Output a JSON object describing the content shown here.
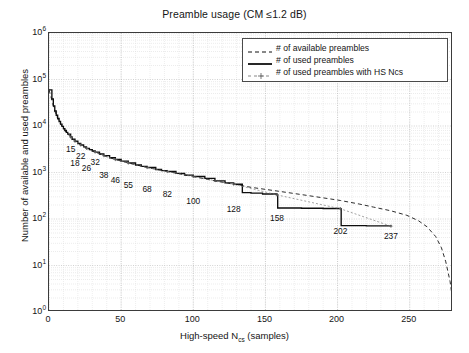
{
  "chart_data": {
    "type": "line",
    "title": "Preamble usage (CM ≤1.2 dB)",
    "xlabel": "High-speed N_cs (samples)",
    "xlabel_main": "High-speed N",
    "xlabel_sub": "cs",
    "xlabel_tail": "(samples)",
    "ylabel": "Number of available and used preambles",
    "xlim": [
      0,
      280
    ],
    "ylim": [
      1,
      1000000
    ],
    "yscale": "log",
    "grid": true,
    "legend_position": "upper right",
    "xticks": [
      0,
      50,
      100,
      150,
      200,
      250
    ],
    "yticks": [
      {
        "label": "10",
        "exp": "0",
        "value": 1
      },
      {
        "label": "10",
        "exp": "1",
        "value": 10
      },
      {
        "label": "10",
        "exp": "2",
        "value": 100
      },
      {
        "label": "10",
        "exp": "3",
        "value": 1000
      },
      {
        "label": "10",
        "exp": "4",
        "value": 10000
      },
      {
        "label": "10",
        "exp": "5",
        "value": 100000
      },
      {
        "label": "10",
        "exp": "6",
        "value": 1000000
      }
    ],
    "legend": [
      {
        "label": "# of available preambles",
        "style": "dashed",
        "color": "#101010"
      },
      {
        "label": "# of used preambles",
        "style": "solid",
        "color": "#101010"
      },
      {
        "label": "# of used preambles with HS Ncs",
        "style": "dotted-marker",
        "color": "#6b6b6b"
      }
    ],
    "annotations": [
      {
        "text": "15",
        "x": 15,
        "y": 5200
      },
      {
        "text": "18",
        "x": 18,
        "y": 2600
      },
      {
        "text": "22",
        "x": 22,
        "y": 3700
      },
      {
        "text": "26",
        "x": 26,
        "y": 2050
      },
      {
        "text": "32",
        "x": 32,
        "y": 2750
      },
      {
        "text": "38",
        "x": 38,
        "y": 1450
      },
      {
        "text": "46",
        "x": 46,
        "y": 1120
      },
      {
        "text": "55",
        "x": 55,
        "y": 900
      },
      {
        "text": "68",
        "x": 68,
        "y": 720
      },
      {
        "text": "82",
        "x": 82,
        "y": 560
      },
      {
        "text": "100",
        "x": 100,
        "y": 400
      },
      {
        "text": "128",
        "x": 128,
        "y": 265
      },
      {
        "text": "158",
        "x": 158,
        "y": 172
      },
      {
        "text": "202",
        "x": 202,
        "y": 90
      },
      {
        "text": "237",
        "x": 237,
        "y": 72
      }
    ],
    "series": [
      {
        "name": "# of available preambles",
        "style": "dashed",
        "points": [
          [
            0,
            60000
          ],
          [
            2,
            36000
          ],
          [
            4,
            21000
          ],
          [
            6,
            14500
          ],
          [
            8,
            11000
          ],
          [
            10,
            8800
          ],
          [
            12,
            7300
          ],
          [
            15,
            5800
          ],
          [
            18,
            4700
          ],
          [
            22,
            3900
          ],
          [
            26,
            3300
          ],
          [
            32,
            2750
          ],
          [
            38,
            2300
          ],
          [
            46,
            1900
          ],
          [
            55,
            1600
          ],
          [
            68,
            1280
          ],
          [
            82,
            1050
          ],
          [
            100,
            820
          ],
          [
            115,
            660
          ],
          [
            128,
            560
          ],
          [
            140,
            480
          ],
          [
            158,
            400
          ],
          [
            175,
            335
          ],
          [
            190,
            285
          ],
          [
            202,
            250
          ],
          [
            215,
            210
          ],
          [
            225,
            180
          ],
          [
            237,
            150
          ],
          [
            248,
            120
          ],
          [
            256,
            92
          ],
          [
            262,
            68
          ],
          [
            268,
            42
          ],
          [
            272,
            24
          ],
          [
            275,
            12
          ],
          [
            278,
            4.5
          ],
          [
            280,
            1.6
          ]
        ]
      },
      {
        "name": "# of used preambles",
        "style": "solid-staircase",
        "points": [
          [
            0,
            60000
          ],
          [
            2,
            38000
          ],
          [
            3,
            27000
          ],
          [
            4,
            21000
          ],
          [
            5,
            17000
          ],
          [
            6,
            14500
          ],
          [
            7,
            12500
          ],
          [
            8,
            11000
          ],
          [
            9,
            9800
          ],
          [
            10,
            8800
          ],
          [
            11,
            8000
          ],
          [
            12,
            7300
          ],
          [
            13,
            6700
          ],
          [
            15,
            5800
          ],
          [
            16,
            5200
          ],
          [
            18,
            4700
          ],
          [
            20,
            4200
          ],
          [
            22,
            3900
          ],
          [
            24,
            3550
          ],
          [
            26,
            3300
          ],
          [
            28,
            3100
          ],
          [
            30,
            2900
          ],
          [
            32,
            2750
          ],
          [
            35,
            2500
          ],
          [
            38,
            2300
          ],
          [
            42,
            2080
          ],
          [
            46,
            1900
          ],
          [
            50,
            1750
          ],
          [
            55,
            1600
          ],
          [
            60,
            1450
          ],
          [
            64,
            1350
          ],
          [
            68,
            1280
          ],
          [
            74,
            1160
          ],
          [
            78,
            1100
          ],
          [
            82,
            1050
          ],
          [
            88,
            960
          ],
          [
            94,
            880
          ],
          [
            100,
            820
          ],
          [
            108,
            745
          ],
          [
            115,
            660
          ],
          [
            122,
            600
          ],
          [
            128,
            560
          ],
          [
            134,
            370
          ],
          [
            140,
            360
          ],
          [
            148,
            345
          ],
          [
            158,
            330
          ],
          [
            158.5,
            172
          ],
          [
            175,
            170
          ],
          [
            190,
            168
          ],
          [
            202,
            166
          ],
          [
            202.5,
            72
          ],
          [
            220,
            71
          ],
          [
            237,
            70
          ]
        ]
      },
      {
        "name": "# of used preambles with HS Ncs",
        "style": "dotted-marker",
        "points": [
          [
            15,
            5800
          ],
          [
            18,
            4700
          ],
          [
            22,
            3900
          ],
          [
            26,
            3300
          ],
          [
            32,
            2750
          ],
          [
            38,
            2300
          ],
          [
            46,
            1900
          ],
          [
            55,
            1600
          ],
          [
            68,
            1280
          ],
          [
            82,
            1050
          ],
          [
            100,
            820
          ],
          [
            128,
            560
          ],
          [
            158,
            330
          ],
          [
            202,
            166
          ],
          [
            237,
            70
          ]
        ]
      }
    ]
  }
}
